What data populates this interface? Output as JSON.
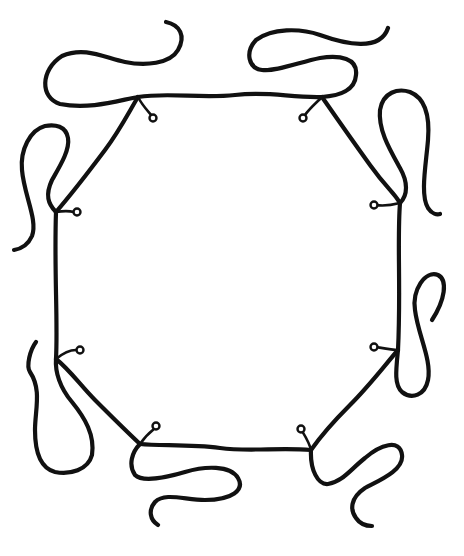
{
  "figure": {
    "width": 464,
    "height": 556,
    "stroke_color": "#111111",
    "background": "#ffffff"
  },
  "octagon": {
    "edges": [
      {
        "name": "top-edge",
        "d": "M 138 97 C 170 92, 200 99, 235 95 S 290 98, 322 97"
      },
      {
        "name": "top-right-edge",
        "d": "M 322 97 C 338 120, 352 140, 370 165 S 392 190, 400 203"
      },
      {
        "name": "right-edge",
        "d": "M 400 203 C 397 240, 401 290, 398 350"
      },
      {
        "name": "bottom-right-edge",
        "d": "M 398 350 C 385 365, 370 385, 350 405 S 318 440, 311 450"
      },
      {
        "name": "bottom-edge",
        "d": "M 311 450 C 280 447, 250 452, 220 448 S 160 446, 140 444"
      },
      {
        "name": "bottom-left-edge",
        "d": "M 140 444 C 125 430, 110 415, 95 400 S 70 370, 56 359"
      },
      {
        "name": "left-edge",
        "d": "M 56 359 C 58 320, 54 270, 56 212"
      },
      {
        "name": "top-left-edge",
        "d": "M 56 212 C 75 190, 90 170, 105 150 S 130 110, 138 97"
      }
    ]
  },
  "eyelets": [
    {
      "name": "eyelet-top-left",
      "hook": "M 138 97 C 142 105, 147 110, 152 116",
      "cx": 153,
      "cy": 118
    },
    {
      "name": "eyelet-top-right",
      "hook": "M 322 97 C 316 103, 309 109, 305 115",
      "cx": 303,
      "cy": 118
    },
    {
      "name": "eyelet-right-top",
      "hook": "M 400 203 C 392 205, 382 206, 376 205",
      "cx": 374,
      "cy": 205
    },
    {
      "name": "eyelet-right-bottom",
      "hook": "M 398 350 C 392 350, 382 348, 376 347",
      "cx": 374,
      "cy": 347
    },
    {
      "name": "eyelet-bottom-right",
      "hook": "M 311 450 C 309 442, 305 436, 302 431",
      "cx": 301,
      "cy": 429
    },
    {
      "name": "eyelet-bottom-left",
      "hook": "M 140 444 C 144 438, 149 433, 154 429",
      "cx": 156,
      "cy": 426
    },
    {
      "name": "eyelet-left-bottom",
      "hook": "M 56 359 C 62 354, 70 350, 76 350",
      "cx": 80,
      "cy": 350
    },
    {
      "name": "eyelet-left-top",
      "hook": "M 56 212 C 62 211, 70 211, 74 212",
      "cx": 77,
      "cy": 212
    }
  ],
  "loose_ends": [
    {
      "name": "loose-end-top-left",
      "d": "M 138 97 C 120 100, 90 110, 60 104 C 40 98, 40 70, 62 56 C 85 46, 105 58, 125 62 C 145 66, 170 64, 178 50 C 186 36, 180 25, 166 22"
    },
    {
      "name": "loose-end-top-right",
      "d": "M 322 97 C 340 96, 355 90, 356 75 C 358 58, 340 55, 320 58 C 300 62, 275 72, 262 70 C 248 68, 245 52, 256 40 C 272 28, 300 28, 320 35 C 345 44, 380 52, 388 28"
    },
    {
      "name": "loose-end-left-top",
      "d": "M 56 212 C 48 204, 45 195, 52 180 C 60 166, 70 150, 68 138 C 66 126, 55 124, 45 126 C 30 130, 20 150, 22 170 C 24 195, 38 220, 32 236 C 28 245, 20 249, 14 250"
    },
    {
      "name": "loose-end-right-top",
      "d": "M 400 203 C 408 195, 408 182, 400 168 C 390 150, 378 130, 380 110 C 383 92, 398 88, 410 92 C 425 98, 430 115, 428 140 C 426 165, 420 195, 428 208 C 432 214, 437 215, 440 214"
    },
    {
      "name": "loose-end-right-bottom",
      "d": "M 398 350 C 396 370, 394 385, 402 392 C 412 400, 425 395, 428 380 C 432 360, 418 335, 415 310 C 412 290, 425 270, 438 275 C 448 280, 445 300, 432 320"
    },
    {
      "name": "loose-end-bottom-right",
      "d": "M 311 450 C 310 470, 318 485, 328 484 C 342 482, 350 470, 365 458 C 380 445, 400 438, 402 455 C 404 470, 380 480, 365 488 C 350 498, 350 510, 356 518 C 360 524, 366 526, 372 526"
    },
    {
      "name": "loose-end-bottom-left",
      "d": "M 140 444 C 132 452, 128 465, 135 475 C 142 482, 165 478, 185 472 C 205 466, 230 465, 238 478 C 245 490, 232 500, 205 500 C 185 500, 165 492, 155 502 C 148 510, 150 520, 158 525"
    },
    {
      "name": "loose-end-left-bottom",
      "d": "M 56 359 C 55 372, 60 388, 72 402 C 85 418, 95 435, 92 455 C 88 470, 70 475, 55 472 C 40 468, 35 452, 35 430 C 35 410, 42 390, 30 372 C 26 366, 30 350, 36 342"
    }
  ]
}
